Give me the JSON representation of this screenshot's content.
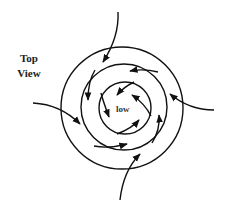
{
  "diagram": {
    "title_line1": "Top",
    "title_line2": "View",
    "center_label": "low",
    "rings": [
      {
        "name": "outer-isobar",
        "cx": 122,
        "cy": 108,
        "r": 61
      },
      {
        "name": "middle-isobar",
        "cx": 124,
        "cy": 107,
        "r": 43
      },
      {
        "name": "inner-isobar",
        "cx": 125,
        "cy": 108,
        "r": 26
      }
    ],
    "colors": {
      "stroke": "#111111",
      "background": "#ffffff"
    }
  }
}
